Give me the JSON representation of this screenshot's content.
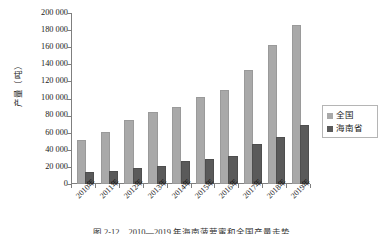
{
  "chart_data": {
    "type": "bar",
    "title": "",
    "xlabel": "",
    "ylabel": "产量（吨）",
    "ylim": [
      0,
      200000
    ],
    "ytick_step": 20000,
    "ytick_labels": [
      "200 000",
      "180 000",
      "160 000",
      "140 000",
      "120 000",
      "100 000",
      "80 000",
      "60 000",
      "40 000",
      "20 000",
      "0"
    ],
    "categories": [
      "2010年",
      "2011年",
      "2012年",
      "2013年",
      "2014年",
      "2015年",
      "2016年",
      "2017年",
      "2018年",
      "2019年"
    ],
    "grid": false,
    "legend_position": "right",
    "series": [
      {
        "name": "全国",
        "color": "#a9a9a9",
        "values": [
          49000,
          59000,
          72000,
          82000,
          88000,
          100000,
          108000,
          131000,
          160000,
          184000
        ]
      },
      {
        "name": "海南省",
        "color": "#5a5a5a",
        "values": [
          11500,
          13000,
          16000,
          19000,
          25000,
          27000,
          31000,
          44500,
          52500,
          67000
        ]
      }
    ]
  },
  "legend": {
    "items": [
      {
        "label": "全国",
        "color": "#a9a9a9"
      },
      {
        "label": "海南省",
        "color": "#5a5a5a"
      }
    ]
  },
  "caption": {
    "text": "图 2-12　2010—2019 年海南菠萝蜜和全国产量走势"
  }
}
